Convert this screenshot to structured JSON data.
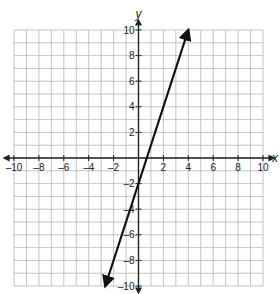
{
  "chart_data": {
    "type": "line",
    "title": "",
    "xlabel": "x",
    "ylabel": "y",
    "xlim": [
      -10,
      10
    ],
    "ylim": [
      -10,
      10
    ],
    "grid": true,
    "x_ticks": [
      -10,
      -8,
      -6,
      -4,
      -2,
      2,
      4,
      6,
      8,
      10
    ],
    "y_ticks": [
      10,
      8,
      6,
      4,
      2,
      -2,
      -4,
      -6,
      -8,
      -10
    ],
    "x_tick_labels": [
      "–10",
      "–8",
      "–6",
      "–4",
      "–2",
      "2",
      "4",
      "6",
      "8",
      "10"
    ],
    "y_tick_labels": [
      "10",
      "8",
      "6",
      "4",
      "2",
      "–2",
      "–4",
      "–6",
      "–8",
      "–10"
    ],
    "series": [
      {
        "name": "line",
        "equation": "y = 3x - 2",
        "slope": 3,
        "intercept": -2,
        "x": [
          -2.67,
          4
        ],
        "y": [
          -10,
          10
        ],
        "arrows": "both"
      }
    ]
  }
}
